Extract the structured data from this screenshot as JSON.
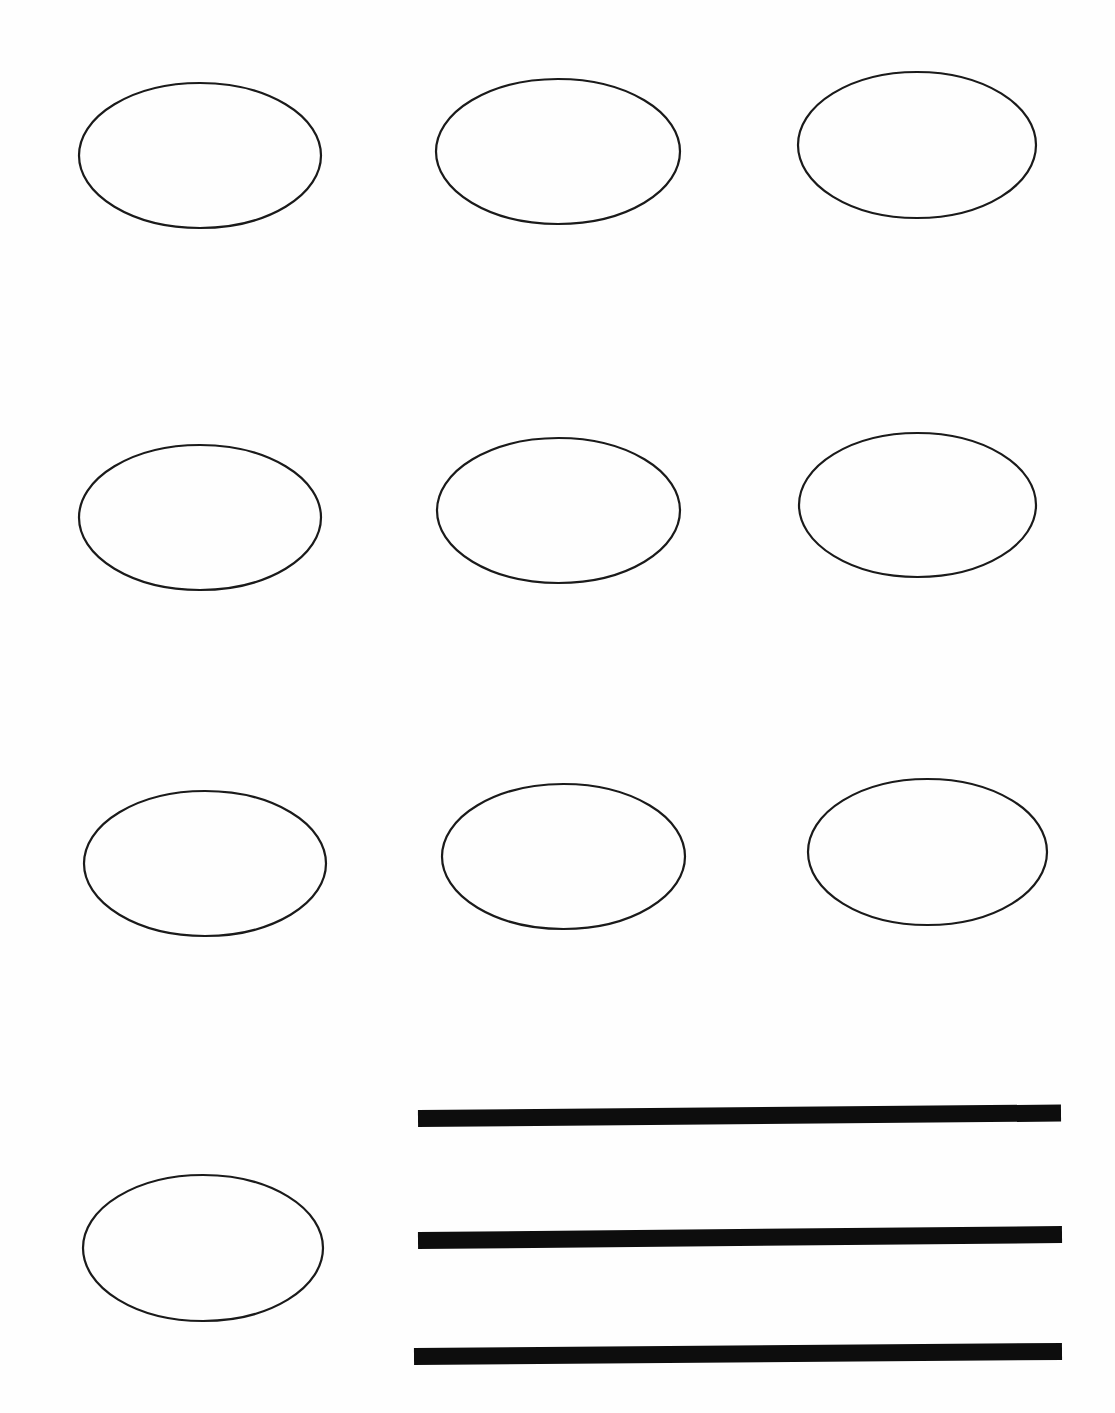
{
  "page": {
    "title": "Oval worksheet",
    "background": "#ffffff",
    "stroke_color": "#1a1a1a",
    "line_color": "#0d0d0d"
  },
  "ovals": [
    {
      "id": 1,
      "row": 1,
      "col": 1,
      "cx": 200,
      "cy": 155.5,
      "rx": 122,
      "ry": 73.5
    },
    {
      "id": 2,
      "row": 1,
      "col": 2,
      "cx": 558,
      "cy": 151.5,
      "rx": 123,
      "ry": 73.5
    },
    {
      "id": 3,
      "row": 1,
      "col": 3,
      "cx": 917,
      "cy": 145,
      "rx": 120,
      "ry": 74
    },
    {
      "id": 4,
      "row": 2,
      "col": 1,
      "cx": 200,
      "cy": 517.5,
      "rx": 122,
      "ry": 73.5
    },
    {
      "id": 5,
      "row": 2,
      "col": 2,
      "cx": 558.5,
      "cy": 510.5,
      "rx": 122.5,
      "ry": 73.5
    },
    {
      "id": 6,
      "row": 2,
      "col": 3,
      "cx": 917.5,
      "cy": 505,
      "rx": 119.5,
      "ry": 73
    },
    {
      "id": 7,
      "row": 3,
      "col": 1,
      "cx": 205,
      "cy": 863.5,
      "rx": 122,
      "ry": 73.5
    },
    {
      "id": 8,
      "row": 3,
      "col": 2,
      "cx": 563.5,
      "cy": 856.5,
      "rx": 122.5,
      "ry": 73.5
    },
    {
      "id": 9,
      "row": 3,
      "col": 3,
      "cx": 927.5,
      "cy": 852,
      "rx": 120.5,
      "ry": 74
    },
    {
      "id": 10,
      "row": 4,
      "col": 1,
      "cx": 203,
      "cy": 1248,
      "rx": 121,
      "ry": 74
    }
  ],
  "writing_lines": [
    {
      "id": 1,
      "x1": 418,
      "y1": 1118.5,
      "x2": 1061,
      "y2": 1113,
      "thickness": 17
    },
    {
      "id": 2,
      "x1": 418,
      "y1": 1240.5,
      "x2": 1062,
      "y2": 1234.5,
      "thickness": 17
    },
    {
      "id": 3,
      "x1": 414,
      "y1": 1356.5,
      "x2": 1062,
      "y2": 1351.5,
      "thickness": 17
    }
  ]
}
